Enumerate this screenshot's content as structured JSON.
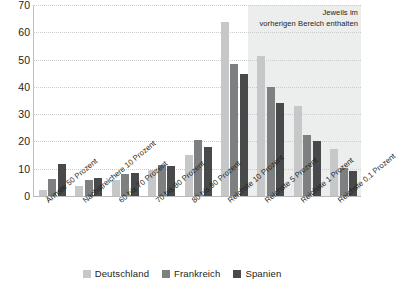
{
  "chart_data": {
    "type": "bar",
    "title": "",
    "subtitle": "",
    "xlabel": "",
    "ylabel": "Prozent",
    "ylim": [
      0,
      70
    ],
    "yticks": [
      0,
      10,
      20,
      30,
      40,
      50,
      60,
      70
    ],
    "grid": true,
    "legend_position": "bottom",
    "categories": [
      "Ärmste 50 Prozent",
      "Nächstreichere 10 Prozent",
      "60 bis 70 Prozent",
      "70 bis 80 Prozent",
      "80 bis 90 Prozent",
      "Reichste 10 Prozent",
      "Reichste 5 Prozent",
      "Reichste 1 Prozent",
      "Reichste 0,1 Prozent"
    ],
    "series": [
      {
        "name": "Deutschland",
        "color": "#c6c7c8",
        "values": [
          2.3,
          3.5,
          6.0,
          9.4,
          15.0,
          63.8,
          51.2,
          33.0,
          17.2
        ]
      },
      {
        "name": "Frankreich",
        "color": "#7d7f81",
        "values": [
          6.1,
          5.7,
          8.1,
          11.4,
          20.5,
          48.4,
          40.0,
          22.2,
          10.1
        ]
      },
      {
        "name": "Spanien",
        "color": "#48494b",
        "values": [
          11.9,
          6.6,
          8.4,
          11.0,
          18.0,
          44.7,
          34.1,
          20.2,
          9.2
        ]
      }
    ],
    "annotations": [
      {
        "name": "shaded-region-note",
        "line1": "Jeweils im",
        "line2": "vorherigen Bereich enthalten",
        "applies_to_categories": [
          "Reichste 5 Prozent",
          "Reichste 1 Prozent",
          "Reichste 0,1 Prozent"
        ]
      }
    ],
    "shaded_band": {
      "start_category": "Reichste 5 Prozent",
      "end_category": "Reichste 0,1 Prozent",
      "color": "#eceded"
    }
  },
  "legend": {
    "items": [
      {
        "label": "Deutschland",
        "color": "#c6c7c8"
      },
      {
        "label": "Frankreich",
        "color": "#7d7f81"
      },
      {
        "label": "Spanien",
        "color": "#48494b"
      }
    ]
  },
  "colors": {
    "background": "#ffffff",
    "text": "#231f20",
    "gridline": "#c9cbcc",
    "axis": "#bcbec0",
    "shade": "#eceded"
  }
}
